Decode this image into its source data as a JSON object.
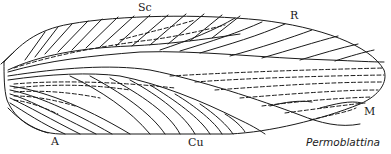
{
  "diagram": {
    "title": "Permoblattina",
    "labels": {
      "sc": "Sc",
      "r": "R",
      "m": "M",
      "a": "A",
      "cu": "Cu"
    },
    "colors": {
      "line": "#1a1a1a",
      "background": "#ffffff"
    }
  }
}
